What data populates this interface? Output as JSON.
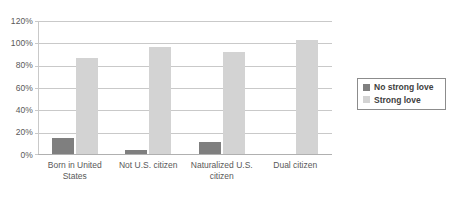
{
  "chart_data": {
    "type": "bar",
    "title": "",
    "xlabel": "",
    "ylabel": "",
    "ylim": [
      0,
      120
    ],
    "ytick_labels": [
      "120%",
      "100%",
      "80%",
      "60%",
      "40%",
      "20%",
      "0%"
    ],
    "ytick_values": [
      120,
      100,
      80,
      60,
      40,
      20,
      0
    ],
    "grid": true,
    "legend_position": "right",
    "categories": [
      "Born in United States",
      "Not U.S. citizen",
      "Naturalized U.S. citizen",
      "Dual citizen"
    ],
    "series": [
      {
        "name": "No strong love",
        "color": "#7f7f7f",
        "values": [
          14,
          4,
          11,
          0
        ]
      },
      {
        "name": "Strong love",
        "color": "#d3d3d3",
        "values": [
          86,
          96,
          91,
          102
        ]
      }
    ]
  },
  "axis": {
    "gridline_color": "#c9c9c9",
    "label_color": "#595959"
  },
  "legend": {
    "entries": [
      {
        "label": "No strong love",
        "color": "#7f7f7f"
      },
      {
        "label": "Strong love",
        "color": "#d3d3d3"
      }
    ]
  }
}
